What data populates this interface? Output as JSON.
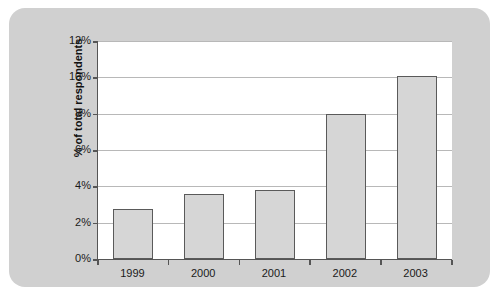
{
  "chart_data": {
    "type": "bar",
    "title": "",
    "subtitle": "",
    "xlabel": "",
    "ylabel": "% of total respondents",
    "categories": [
      "1999",
      "2000",
      "2001",
      "2002",
      "2003"
    ],
    "values": [
      2.75,
      3.6,
      3.8,
      8.0,
      10.1
    ],
    "series": [
      {
        "name": "% of total respondents",
        "values": [
          2.75,
          3.6,
          3.8,
          8.0,
          10.1
        ]
      }
    ],
    "ylim": [
      0,
      12
    ],
    "ytick_values": [
      0,
      2,
      4,
      6,
      8,
      10,
      12
    ],
    "ytick_labels": [
      "0%",
      "2%",
      "4%",
      "6%",
      "8%",
      "10%",
      "12%"
    ],
    "grid": true,
    "grid_axis": "y",
    "legend": false,
    "legend_position": "none",
    "bar_fill_color": "#d6d6d6",
    "bar_edge_color": "#5a5a5a",
    "plot_background_color": "#ffffff",
    "panel_background_color": "#d0d0d0",
    "gridline_color": "#b8b8b8",
    "axis_color": "#555555",
    "text_color": "#1a1a1a"
  }
}
